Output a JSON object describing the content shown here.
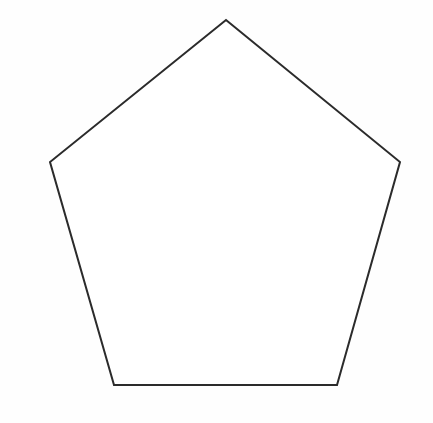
{
  "canvas": {
    "width": 433,
    "height": 423,
    "background_color": "#fefefe",
    "description": "Blank white drawing canvas containing a single geometric line drawing"
  },
  "figure": {
    "name": "pentagon",
    "shape_type": "regular-pentagon",
    "orientation": "apex-up",
    "sides": 5,
    "fill_color": "#ffffff",
    "stroke_color": "#2b2b2b",
    "stroke_width": 2,
    "closed": true,
    "points_attr": "226,20 400,162 337,385 114,385 50,162",
    "vertices": [
      {
        "name": "apex-top",
        "x": 226,
        "y": 20
      },
      {
        "name": "upper-right",
        "x": 400,
        "y": 162
      },
      {
        "name": "lower-right",
        "x": 337,
        "y": 385
      },
      {
        "name": "lower-left",
        "x": 114,
        "y": 385
      },
      {
        "name": "upper-left",
        "x": 50,
        "y": 162
      }
    ],
    "edges": [
      {
        "name": "top-right-edge",
        "from": "apex-top",
        "to": "upper-right"
      },
      {
        "name": "right-edge",
        "from": "upper-right",
        "to": "lower-right"
      },
      {
        "name": "bottom-edge",
        "from": "lower-right",
        "to": "lower-left"
      },
      {
        "name": "left-edge",
        "from": "lower-left",
        "to": "upper-left"
      },
      {
        "name": "top-left-edge",
        "from": "upper-left",
        "to": "apex-top"
      }
    ]
  }
}
